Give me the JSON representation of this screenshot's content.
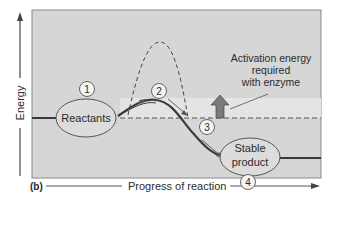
{
  "figure": {
    "panel_label": "(b)",
    "x_axis_label": "Progress of reaction",
    "y_axis_label": "Energy",
    "annotation": {
      "line1": "Activation energy",
      "line2": "required",
      "line3": "with enzyme"
    },
    "nodes": [
      {
        "number": "1",
        "label": "Reactants"
      },
      {
        "number": "2",
        "label": ""
      },
      {
        "number": "3",
        "label": ""
      },
      {
        "number": "4",
        "label_line1": "Stable",
        "label_line2": "product"
      }
    ],
    "colors": {
      "panel_bg": "#d6d6d6",
      "panel_border": "#8a8a8a",
      "band_bg": "#e6e6e6",
      "curve": "#3a3a3a",
      "arrow_fill": "#7a7a7a",
      "ellipse_fill": "#dcdcdc",
      "text": "#2b2b2b"
    }
  }
}
